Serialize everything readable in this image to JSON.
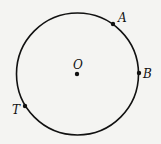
{
  "diagram": {
    "type": "circle-with-points",
    "circle": {
      "cx": 77.5,
      "cy": 74,
      "r": 61,
      "stroke": "#111111"
    },
    "points": [
      {
        "name": "O",
        "label": "O",
        "x": 77,
        "y": 74,
        "label_x": 73,
        "label_y": 69,
        "role": "center"
      },
      {
        "name": "A",
        "label": "A",
        "x": 113,
        "y": 24,
        "label_x": 118,
        "label_y": 22,
        "role": "on-circle"
      },
      {
        "name": "B",
        "label": "B",
        "x": 139,
        "y": 73,
        "label_x": 143,
        "label_y": 78,
        "role": "on-circle"
      },
      {
        "name": "T",
        "label": "T",
        "x": 25,
        "y": 106,
        "label_x": 12,
        "label_y": 114,
        "role": "on-circle"
      }
    ]
  }
}
